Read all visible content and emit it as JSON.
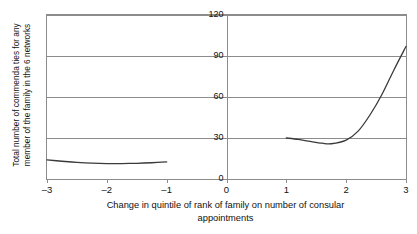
{
  "chart_data": {
    "type": "line",
    "title": "",
    "xlabel": "Change in quintile of rank of family on number of consular appointments",
    "xlabel_line1": "Change in quintile of rank of family on number of consular",
    "xlabel_line2": "appointments",
    "ylabel": "Total number of commenda ties for any member of the family in the 6 networks",
    "ylabel_line1": "Total number of commenda ties for any",
    "ylabel_line2": "member of the family in the 6 networks",
    "xlim": [
      -3,
      3
    ],
    "ylim": [
      0,
      120
    ],
    "xticks": [
      -3,
      -2,
      -1,
      0,
      1,
      2,
      3
    ],
    "xticklabels": [
      "–3",
      "–2",
      "–1",
      "0",
      "1",
      "2",
      "3"
    ],
    "yticks": [
      0,
      30,
      60,
      90,
      120
    ],
    "yticklabels": [
      "0",
      "30",
      "60",
      "90",
      "120"
    ],
    "grid": "horizontal",
    "legend": "none",
    "line_color": "#3a3a3a",
    "axis_color": "#8c8c8c",
    "background": "#ffffff",
    "series": [
      {
        "name": "left-branch",
        "x": [
          -3.0,
          -2.75,
          -2.5,
          -2.25,
          -2.0,
          -1.75,
          -1.5,
          -1.25,
          -1.0
        ],
        "values": [
          14.0,
          13.0,
          12.2,
          11.6,
          11.3,
          11.3,
          11.5,
          11.9,
          12.5
        ]
      },
      {
        "name": "right-branch",
        "x": [
          1.0,
          1.2,
          1.4,
          1.6,
          1.75,
          2.0,
          2.2,
          2.4,
          2.6,
          2.8,
          3.0
        ],
        "values": [
          30.0,
          29.0,
          27.5,
          26.2,
          25.8,
          28.5,
          35.0,
          47.0,
          62.0,
          80.0,
          97.0
        ]
      }
    ]
  }
}
